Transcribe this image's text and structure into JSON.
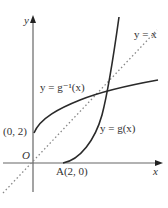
{
  "axes": {
    "x_label": "x",
    "y_label": "y",
    "origin_label": "O"
  },
  "curves": [
    {
      "name": "g",
      "label": "y = g(x)"
    },
    {
      "name": "g-inverse",
      "label": "y = g⁻¹(x)"
    },
    {
      "name": "identity",
      "label": "y = x",
      "style": "dotted"
    }
  ],
  "points": [
    {
      "name": "A",
      "label": "A(2, 0)"
    },
    {
      "name": "y-intercept",
      "label": "(0, 2)"
    }
  ],
  "colors": {
    "curve": "#2a2a2a",
    "axis": "#555555",
    "dotted": "#888888"
  }
}
